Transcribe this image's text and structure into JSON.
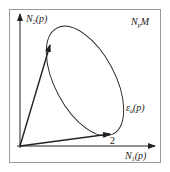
{
  "diagram": {
    "labels": {
      "y_axis": "N",
      "y_axis_sub": "2",
      "y_axis_arg": "(p)",
      "x_axis": "N",
      "x_axis_sub": "1",
      "x_axis_arg": "(p)",
      "space": "N",
      "space_sub": "p",
      "space_rest": "M",
      "ellipse": "ε",
      "ellipse_sub": "a",
      "ellipse_arg": "(p)",
      "vector2": "2"
    },
    "colors": {
      "stroke": "#222222",
      "frame": "#9a9a9a"
    }
  }
}
